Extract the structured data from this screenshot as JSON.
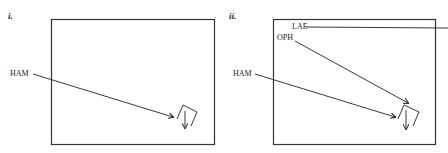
{
  "panels": [
    {
      "id": "i",
      "label": "i.",
      "annotations": [
        {
          "text": "HAM"
        }
      ]
    },
    {
      "id": "ii",
      "label": "ii.",
      "annotations": [
        {
          "text": "LAE"
        },
        {
          "text": "OPH"
        },
        {
          "text": "HAM"
        }
      ]
    }
  ],
  "colors": {
    "stroke": "#222222",
    "frame": "#333333",
    "background": "#ffffff"
  }
}
